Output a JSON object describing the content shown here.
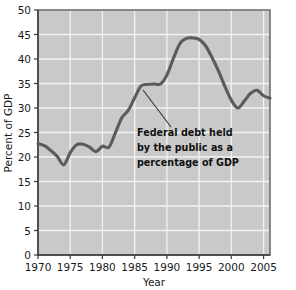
{
  "chart_data": {
    "type": "line",
    "title": "",
    "xlabel": "Year",
    "ylabel": "Percent of GDP",
    "xlim": [
      1970,
      2006
    ],
    "ylim": [
      0,
      50
    ],
    "grid": true,
    "legend": "none",
    "xticks": [
      "1970",
      "1975",
      "1980",
      "1985",
      "1990",
      "1995",
      "2000",
      "2005"
    ],
    "xtick_values": [
      1970,
      1975,
      1980,
      1985,
      1990,
      1995,
      2000,
      2005
    ],
    "yticks": [
      "0",
      "5",
      "10",
      "15",
      "20",
      "25",
      "30",
      "35",
      "40",
      "45",
      "50"
    ],
    "ytick_values": [
      0,
      5,
      10,
      15,
      20,
      25,
      30,
      35,
      40,
      45,
      50
    ],
    "series": [
      {
        "name": "Federal debt held by the public as a percentage of GDP",
        "color": "#5b5b5b",
        "x": [
          1970,
          1971,
          1972,
          1973,
          1974,
          1975,
          1976,
          1977,
          1978,
          1979,
          1980,
          1981,
          1982,
          1983,
          1984,
          1985,
          1986,
          1987,
          1988,
          1989,
          1990,
          1991,
          1992,
          1993,
          1994,
          1995,
          1996,
          1997,
          1998,
          1999,
          2000,
          2001,
          2002,
          2003,
          2004,
          2005,
          2006
        ],
        "values": [
          22.7,
          22.3,
          21.3,
          20.1,
          18.4,
          20.9,
          22.5,
          22.6,
          22.0,
          21.1,
          22.2,
          22.0,
          24.9,
          28.0,
          29.5,
          32.1,
          34.5,
          34.8,
          34.9,
          34.9,
          36.7,
          40.1,
          43.1,
          44.2,
          44.3,
          44.0,
          42.7,
          40.3,
          37.6,
          34.4,
          31.6,
          30.0,
          31.4,
          33.0,
          33.6,
          32.5,
          32.0
        ]
      }
    ],
    "annotations": [
      {
        "name": "series-callout",
        "lines": [
          "Federal debt held",
          "by the public as a",
          "percentage of GDP"
        ],
        "points_to_year": 1987,
        "points_to_value": 35
      }
    ]
  }
}
